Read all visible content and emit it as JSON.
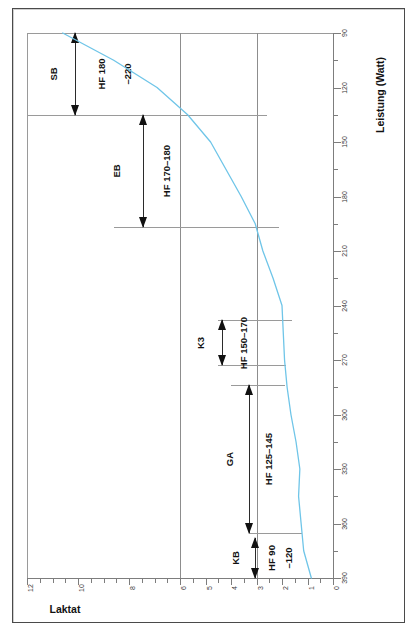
{
  "figure": {
    "outer_frame": true,
    "background": "#ffffff"
  },
  "axes": {
    "y_axis": {
      "name": "laktat-axis",
      "title": "Laktat",
      "orientation": "horizontal-bottom",
      "direction": "12-left-to-0-right",
      "labels": [
        "12",
        "10",
        "8",
        "6",
        "5",
        "4",
        "3",
        "2",
        "1",
        "0"
      ]
    },
    "x_axis": {
      "name": "leistung-axis",
      "title": "Leistung (Watt)",
      "orientation": "vertical-right",
      "direction": "390-top-to-90-bottom",
      "labels": [
        "390",
        "360",
        "330",
        "300",
        "270",
        "240",
        "210",
        "180",
        "150",
        "120",
        "90"
      ]
    }
  },
  "zones": [
    {
      "key": "sb",
      "name": "SB",
      "hf_line1": "HF 180",
      "hf_line2": "–220"
    },
    {
      "key": "eb",
      "name": "EB",
      "hf_line1": "HF 170–180",
      "hf_line2": ""
    },
    {
      "key": "k3",
      "name": "K3",
      "hf_line1": "HF 150–170",
      "hf_line2": ""
    },
    {
      "key": "ga",
      "name": "GA",
      "hf_line1": "HF 125–145",
      "hf_line2": ""
    },
    {
      "key": "kb",
      "name": "KB",
      "hf_line1": "HF 90",
      "hf_line2": "–120"
    }
  ],
  "colors": {
    "curve": "#6fc5e8",
    "grid": "#8d8d8d",
    "axis": "#7d7d7d",
    "text": "#111111",
    "frame": "#4a4a4a"
  },
  "chart_data": {
    "type": "line",
    "title": "",
    "subtitle": "",
    "xlabel": "Laktat",
    "ylabel": "Leistung (Watt)",
    "orientation": "rotated-90deg",
    "grid": true,
    "legend": null,
    "xlim": [
      0,
      12
    ],
    "ylim": [
      90,
      390
    ],
    "xticks": [
      0,
      1,
      2,
      3,
      4,
      5,
      6,
      8,
      10,
      12
    ],
    "yticks": [
      90,
      120,
      150,
      180,
      210,
      240,
      270,
      300,
      330,
      360,
      390
    ],
    "series": [
      {
        "name": "Laktatkurve",
        "color": "#6fc5e8",
        "x_label": "Leistung (Watt)",
        "y_label": "Laktat (mmol/l)",
        "points": [
          {
            "watt": 90,
            "laktat": 0.85
          },
          {
            "watt": 105,
            "laktat": 1.15
          },
          {
            "watt": 120,
            "laktat": 1.25
          },
          {
            "watt": 135,
            "laktat": 1.35
          },
          {
            "watt": 150,
            "laktat": 1.3
          },
          {
            "watt": 165,
            "laktat": 1.45
          },
          {
            "watt": 180,
            "laktat": 1.65
          },
          {
            "watt": 195,
            "laktat": 1.8
          },
          {
            "watt": 210,
            "laktat": 1.9
          },
          {
            "watt": 225,
            "laktat": 1.95
          },
          {
            "watt": 240,
            "laktat": 2.0
          },
          {
            "watt": 255,
            "laktat": 2.35
          },
          {
            "watt": 270,
            "laktat": 2.75
          },
          {
            "watt": 285,
            "laktat": 3.05
          },
          {
            "watt": 300,
            "laktat": 3.6
          },
          {
            "watt": 315,
            "laktat": 4.2
          },
          {
            "watt": 330,
            "laktat": 4.8
          },
          {
            "watt": 345,
            "laktat": 5.7
          },
          {
            "watt": 360,
            "laktat": 6.9
          },
          {
            "watt": 375,
            "laktat": 8.6
          },
          {
            "watt": 390,
            "laktat": 10.6
          }
        ]
      }
    ],
    "gridlines_laktat": [
      3,
      6
    ],
    "zone_boundaries_watt": [
      90,
      115,
      207,
      232,
      283,
      345,
      390
    ],
    "training_zones": [
      {
        "name": "KB",
        "hf": "HF 90–120",
        "watt_from": 90,
        "watt_to": 115
      },
      {
        "name": "GA",
        "hf": "HF 125–145",
        "watt_from": 115,
        "watt_to": 207
      },
      {
        "name": "K3",
        "hf": "HF 150–170",
        "watt_from": 232,
        "watt_to": 283
      },
      {
        "name": "EB",
        "hf": "HF 170–180",
        "watt_from": 283,
        "watt_to": 345
      },
      {
        "name": "SB",
        "hf": "HF 180–220",
        "watt_from": 345,
        "watt_to": 390
      }
    ]
  }
}
